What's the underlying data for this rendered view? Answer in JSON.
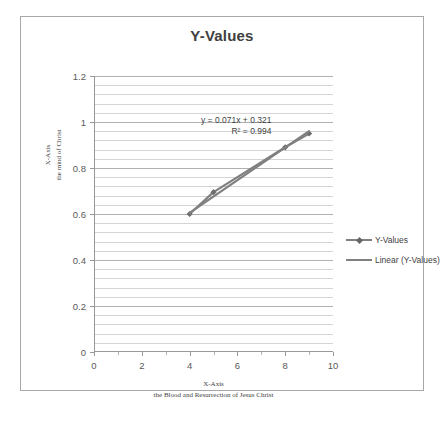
{
  "chart_data": {
    "type": "line",
    "title": "Y-Values",
    "xlabel_line1": "X-Axis",
    "xlabel_line2": "the Blood and Resurrection of Jesus Christ",
    "ylabel_line1": "X-Axis",
    "ylabel_line2": "the mind of Christ",
    "xlim": [
      0,
      10
    ],
    "ylim": [
      0,
      1.2
    ],
    "x_major_ticks": [
      "0",
      "2",
      "4",
      "6",
      "8",
      "10"
    ],
    "x_major_values": [
      0,
      2,
      4,
      6,
      8,
      10
    ],
    "x_minor_values": [
      1,
      3,
      5,
      7,
      9
    ],
    "y_major_ticks": [
      "0",
      "0.2",
      "0.4",
      "0.6",
      "0.8",
      "1",
      "1.2"
    ],
    "y_major_values": [
      0,
      0.2,
      0.4,
      0.6,
      0.8,
      1,
      1.2
    ],
    "y_minor_step": 0.04,
    "grid": true,
    "legend_position": "right",
    "series": [
      {
        "name": "Y-Values",
        "type": "line-markers",
        "color": "#808080",
        "x": [
          4,
          5,
          8,
          9
        ],
        "values": [
          0.6,
          0.695,
          0.89,
          0.95
        ]
      },
      {
        "name": "Linear (Y-Values)",
        "type": "trendline",
        "color": "#808080",
        "slope": 0.071,
        "intercept": 0.321,
        "x_start": 4,
        "x_end": 9
      }
    ],
    "annotations": {
      "equation": "y = 0.071x + 0.321",
      "r_squared": "R² = 0.994"
    },
    "legend": [
      {
        "label": "Y-Values",
        "marker": "diamond-line"
      },
      {
        "label": "Linear (Y-Values)",
        "marker": "line"
      }
    ]
  }
}
